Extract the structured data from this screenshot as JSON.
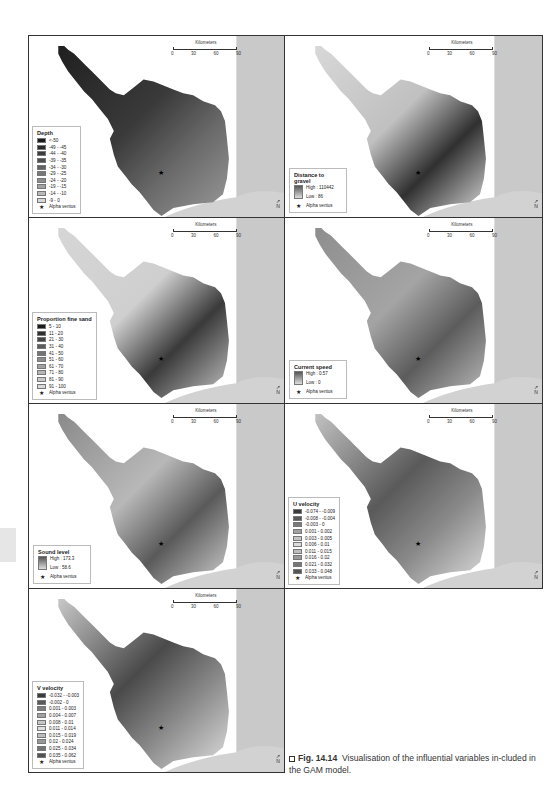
{
  "figure": {
    "label": "Fig. 14.14",
    "caption": "Visualisation of the influential variables in-cluded in the GAM model."
  },
  "scalebar": {
    "title": "Kilometers",
    "ticks": [
      "0",
      "30",
      "60",
      "90"
    ]
  },
  "north_arrow": "N",
  "marker_label": "Alpha ventus",
  "panels": [
    {
      "id": "depth",
      "legend_title": "Depth",
      "legend_type": "classes",
      "classes": [
        {
          "label": "<-50",
          "color": "#1a1a1a"
        },
        {
          "label": "-49 - -45",
          "color": "#2b2b2b"
        },
        {
          "label": "-44 - -40",
          "color": "#3c3c3c"
        },
        {
          "label": "-39 - -35",
          "color": "#4e4e4e"
        },
        {
          "label": "-34 - -30",
          "color": "#626262"
        },
        {
          "label": "-29 - -25",
          "color": "#777777"
        },
        {
          "label": "-24 - -20",
          "color": "#8d8d8d"
        },
        {
          "label": "-19 - -15",
          "color": "#a3a3a3"
        },
        {
          "label": "-14 - -10",
          "color": "#bababa"
        },
        {
          "label": "-9 - 0",
          "color": "#d6d6d6"
        }
      ]
    },
    {
      "id": "distance-to-gravel",
      "legend_title": "Distance to gravel",
      "legend_type": "ramp",
      "high": "High : 110442",
      "low": "Low : 86"
    },
    {
      "id": "proportion-fine-sand",
      "legend_title": "Proportion fine sand",
      "legend_type": "classes",
      "classes": [
        {
          "label": "5 - 10",
          "color": "#1a1a1a"
        },
        {
          "label": "11 - 20",
          "color": "#2e2e2e"
        },
        {
          "label": "21 - 30",
          "color": "#444444"
        },
        {
          "label": "31 - 40",
          "color": "#5c5c5c"
        },
        {
          "label": "41 - 50",
          "color": "#747474"
        },
        {
          "label": "51 - 60",
          "color": "#8c8c8c"
        },
        {
          "label": "61 - 70",
          "color": "#a2a2a2"
        },
        {
          "label": "71 - 80",
          "color": "#b6b6b6"
        },
        {
          "label": "81 - 90",
          "color": "#c8c8c8"
        },
        {
          "label": "91 - 100",
          "color": "#dadada"
        }
      ]
    },
    {
      "id": "current-speed",
      "legend_title": "Current speed",
      "legend_type": "ramp",
      "high": "High : 0.57",
      "low": "Low : 0"
    },
    {
      "id": "sound-level",
      "legend_title": "Sound level",
      "legend_type": "ramp",
      "high": "High : 173.3",
      "low": "Low : 58.6"
    },
    {
      "id": "u-velocity",
      "legend_title": "U velocity",
      "legend_type": "classes",
      "classes": [
        {
          "label": "-0.074 - -0.009",
          "color": "#3a3a3a"
        },
        {
          "label": "-0.008 - -0.004",
          "color": "#5a5a5a"
        },
        {
          "label": "-0.003 - 0",
          "color": "#7a7a7a"
        },
        {
          "label": "0.001 - 0.002",
          "color": "#a0a0a0"
        },
        {
          "label": "0.003 - 0.005",
          "color": "#c4c4c4"
        },
        {
          "label": "0.006 - 0.01",
          "color": "#dcdcdc"
        },
        {
          "label": "0.011 - 0.015",
          "color": "#bdbdbd"
        },
        {
          "label": "0.016 - 0.02",
          "color": "#9a9a9a"
        },
        {
          "label": "0.021 - 0.032",
          "color": "#777777"
        },
        {
          "label": "0.033 - 0.048",
          "color": "#555555"
        }
      ]
    },
    {
      "id": "v-velocity",
      "legend_title": "V velocity",
      "legend_type": "classes",
      "classes": [
        {
          "label": "-0.032 - -0.003",
          "color": "#3a3a3a"
        },
        {
          "label": "-0.002 - 0",
          "color": "#5a5a5a"
        },
        {
          "label": "0.001 - 0.003",
          "color": "#7e7e7e"
        },
        {
          "label": "0.004 - 0.007",
          "color": "#a2a2a2"
        },
        {
          "label": "0.008 - 0.01",
          "color": "#c6c6c6"
        },
        {
          "label": "0.011 - 0.014",
          "color": "#dedede"
        },
        {
          "label": "0.015 - 0.019",
          "color": "#bcbcbc"
        },
        {
          "label": "0.02 - 0.024",
          "color": "#989898"
        },
        {
          "label": "0.025 - 0.034",
          "color": "#747474"
        },
        {
          "label": "0.035 - 0.062",
          "color": "#525252"
        }
      ]
    }
  ]
}
